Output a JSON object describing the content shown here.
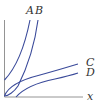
{
  "diagram": {
    "type": "curve-sketch",
    "x_axis_label": "x",
    "curves": [
      {
        "label": "A",
        "shape": "steep rising curve"
      },
      {
        "label": "B",
        "shape": "steep rising curve"
      },
      {
        "label": "C",
        "shape": "slowly rising curve"
      },
      {
        "label": "D",
        "shape": "slowly rising curve"
      }
    ],
    "colors": {
      "curve": "#3a4a9a",
      "axis": "#888888",
      "text": "#333333"
    }
  }
}
